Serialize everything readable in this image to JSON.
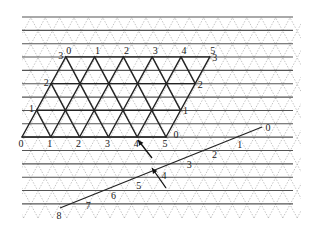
{
  "diagram": {
    "colors": {
      "background": "#ffffff",
      "horizontal_lines": "#555555",
      "dashed_lattice": "#999999",
      "thick_lattice": "#222222",
      "labels": "#222222"
    },
    "lattice": {
      "row_y_start": 17,
      "row_spacing": 13.35,
      "row_count": 15,
      "x_left": 22,
      "x_right": 293,
      "triangle_half_width": 7.2
    },
    "parallelogram": {
      "bottom_labels": [
        "0",
        "1",
        "2",
        "3",
        "4",
        "5"
      ],
      "top_labels": [
        "0",
        "1",
        "2",
        "3",
        "4",
        "5"
      ],
      "left_labels": [
        "0",
        "1",
        "2",
        "3"
      ],
      "right_labels": [
        "0",
        "1",
        "2",
        "3"
      ]
    },
    "inclined_line": {
      "labels": [
        "0",
        "1",
        "2",
        "3",
        "4",
        "5",
        "6",
        "7",
        "8"
      ]
    },
    "arrows": [
      {
        "name": "arrow-upper",
        "from": [
          152,
          158
        ],
        "to": [
          138,
          140
        ]
      },
      {
        "name": "arrow-lower",
        "from": [
          166,
          188
        ],
        "to": [
          152,
          168
        ]
      }
    ]
  }
}
